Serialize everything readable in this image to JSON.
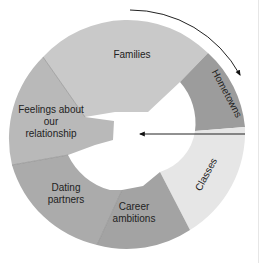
{
  "diagram": {
    "type": "segmented-ring",
    "center": [
      130,
      133
    ],
    "outer_radius": 115,
    "segments": [
      {
        "id": "families",
        "label_lines": [
          "Families"
        ],
        "color": "#c9c9c9",
        "label_pos": [
          132,
          58
        ],
        "rotate": 0
      },
      {
        "id": "hometowns",
        "label_lines": [
          "Hometowns"
        ],
        "color": "#9c9c9c",
        "label_pos": [
          224,
          95
        ],
        "rotate": 62
      },
      {
        "id": "classes",
        "label_lines": [
          "Classes"
        ],
        "color": "#e6e6e6",
        "label_pos": [
          209,
          176
        ],
        "rotate": -62
      },
      {
        "id": "career",
        "label_lines": [
          "Career",
          "ambitions"
        ],
        "color": "#a3a3a3",
        "label_pos": [
          134,
          214
        ],
        "rotate": 0
      },
      {
        "id": "dating",
        "label_lines": [
          "Dating",
          "partners"
        ],
        "color": "#ababab",
        "label_pos": [
          66,
          192
        ],
        "rotate": 0
      },
      {
        "id": "feelings",
        "label_lines": [
          "Feelings about",
          "our",
          "relationship"
        ],
        "color": "#b9b9b9",
        "label_pos": [
          49,
          112
        ],
        "rotate": 0
      }
    ],
    "arrows": [
      {
        "id": "clockwise-arrow",
        "description": "curved arrow along outer top-right edge pointing downward"
      },
      {
        "id": "inward-arrow",
        "description": "straight arrow pointing left into center"
      }
    ]
  }
}
